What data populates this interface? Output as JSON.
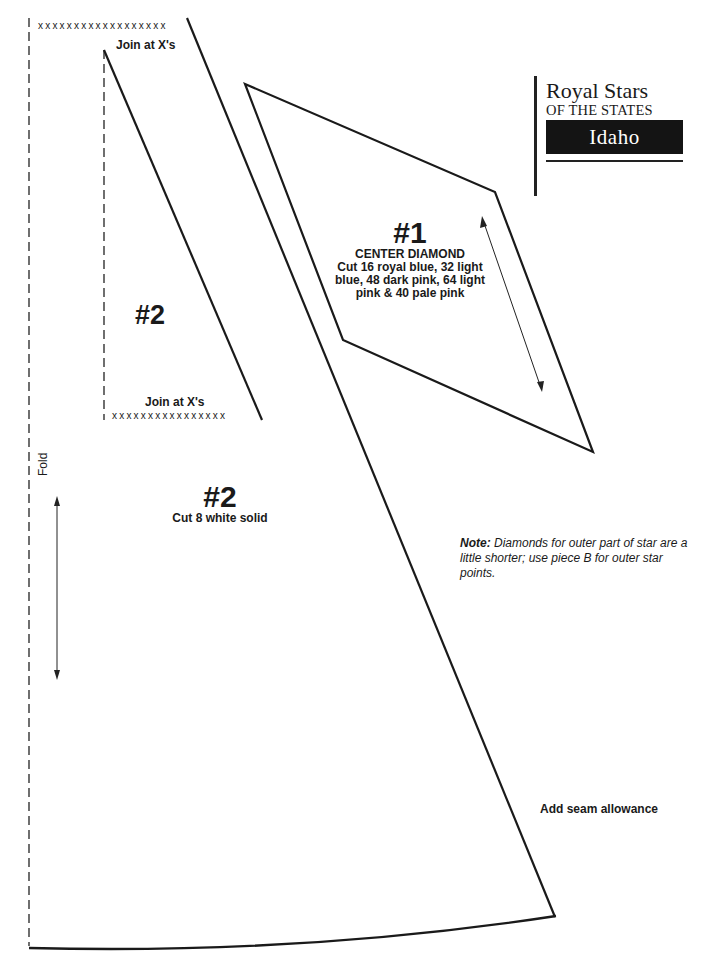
{
  "header": {
    "title_line1": "Royal Stars",
    "title_line2": "OF THE STATES",
    "state": "Idaho"
  },
  "piece2_strip": {
    "top_xs": "xxxxxxxxxxxxxxxxxx",
    "top_join_label": "Join at X's",
    "label": "#2",
    "bottom_join_label": "Join at X's",
    "bottom_xs": "xxxxxxxxxxxxxxxx"
  },
  "piece1": {
    "number": "#1",
    "name": "CENTER DIAMOND",
    "instructions_lines": [
      "Cut 16 royal blue, 32 light",
      "blue, 48 dark pink, 64 light",
      "pink & 40 pale pink"
    ]
  },
  "piece2_main": {
    "number": "#2",
    "instructions": "Cut 8 white solid",
    "fold_label": "Fold"
  },
  "note": {
    "label": "Note:",
    "text": "Diamonds for outer part of star are a little shorter; use piece B for outer star points."
  },
  "seam_note": "Add seam allowance",
  "colors": {
    "ink": "#1a1a1a",
    "paper": "#ffffff",
    "title_box_bg": "#141414",
    "title_box_text": "#ffffff"
  }
}
